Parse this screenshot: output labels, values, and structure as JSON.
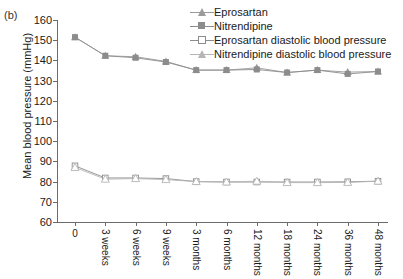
{
  "panel_label": "(b)",
  "chart_data": {
    "type": "line",
    "title": "",
    "xlabel": "",
    "ylabel": "Mean blood pressure (mmHg)",
    "ylim": [
      60,
      160
    ],
    "ytick_step": 10,
    "yticks": [
      60,
      70,
      80,
      90,
      100,
      110,
      120,
      130,
      140,
      150,
      160
    ],
    "grid": false,
    "legend_position": "top-right",
    "categories": [
      "0",
      "3 weeks",
      "6 weeks",
      "9 weeks",
      "3 months",
      "6 months",
      "12 months",
      "18 months",
      "24 months",
      "36 months",
      "48 months"
    ],
    "series": [
      {
        "name": "Eprosartan",
        "marker": "filled-triangle",
        "color": "#9a9a9a",
        "values": [
          151.5,
          142.3,
          141.8,
          139.5,
          135.2,
          135.2,
          136.3,
          134.0,
          135.2,
          134.2,
          134.5
        ]
      },
      {
        "name": "Nitrendipine",
        "marker": "filled-square",
        "color": "#8c8c8c",
        "values": [
          151.5,
          142.3,
          141.3,
          139.2,
          135.2,
          135.2,
          135.5,
          134.0,
          135.2,
          133.3,
          134.5
        ]
      },
      {
        "name": "Eprosartan diastolic blood pressure",
        "marker": "open-square",
        "color": "#8c8c8c",
        "values": [
          87.8,
          81.8,
          81.8,
          81.5,
          80.0,
          79.8,
          79.8,
          79.8,
          79.8,
          79.9,
          80.2
        ]
      },
      {
        "name": "Nitrendipine diastolic blood pressure",
        "marker": "open-triangle",
        "color": "#b5b5b5",
        "values": [
          87.0,
          81.2,
          81.5,
          81.0,
          80.0,
          79.8,
          80.2,
          79.5,
          79.5,
          79.6,
          80.2
        ]
      }
    ]
  }
}
